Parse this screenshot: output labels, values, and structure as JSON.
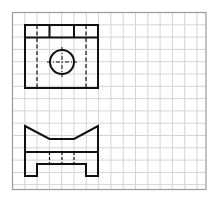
{
  "diagram": {
    "type": "orthographic-projection",
    "grid": {
      "x0": 12.5,
      "y0": 12.5,
      "x1": 206,
      "y1": 189.5,
      "step": 12.3,
      "line_color": "#d4d4d4",
      "border_color": "#9a9a9a"
    },
    "stroke_color": "#111111",
    "views": {
      "top_view": {
        "outline": {
          "x": 25,
          "y": 25,
          "w": 73,
          "h": 63
        },
        "top_strip_line_y": 37.5,
        "strip_dividers_x": [
          49.5,
          74
        ],
        "hidden_lines_x": [
          37,
          86
        ],
        "hole": {
          "cx": 62,
          "cy": 62,
          "r": 12
        }
      },
      "front_view": {
        "outline_points": "25,126 25,176 37,176 37,164 86,164 86,176 98,176 98,126 74,139 49.5,139",
        "middle_line_y": 152,
        "hidden_lines_x": [
          49.5,
          62,
          74
        ],
        "hidden_lines_y": [
          152,
          164
        ]
      }
    }
  }
}
